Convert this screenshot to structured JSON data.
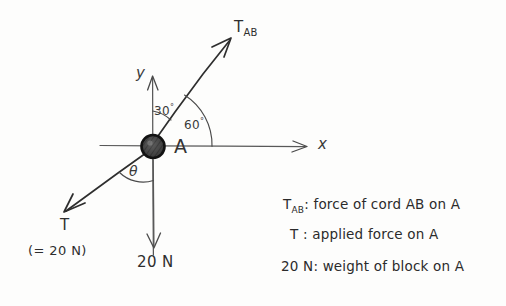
{
  "diagram": {
    "point_label": "A",
    "axes": {
      "x_label": "x",
      "y_label": "y"
    },
    "angles": [
      {
        "name": "angle-30",
        "value": "30",
        "degree_symbol": "°"
      },
      {
        "name": "angle-60",
        "value": "60",
        "degree_symbol": "°"
      },
      {
        "name": "angle-theta",
        "symbol": "θ"
      }
    ],
    "vectors": [
      {
        "name": "T_AB",
        "base": "T",
        "subscript": "AB"
      },
      {
        "name": "T",
        "base": "T",
        "subscript": "",
        "note": "(= 20 N)"
      },
      {
        "name": "weight",
        "base": "20 N",
        "subscript": ""
      }
    ],
    "ink_color": "#2b2b2b",
    "axis_color": "#555555",
    "paper_color": "#fdfdfc"
  },
  "legend": {
    "lines": [
      {
        "sym": "T",
        "sub": "AB",
        "sep": ":",
        "text": "force of cord AB on A"
      },
      {
        "sym": "T",
        "sub": "",
        "sep": ":",
        "text": "applied force on A"
      },
      {
        "sym": "20 N",
        "sub": "",
        "sep": ":",
        "text": "weight of block on A"
      }
    ]
  }
}
